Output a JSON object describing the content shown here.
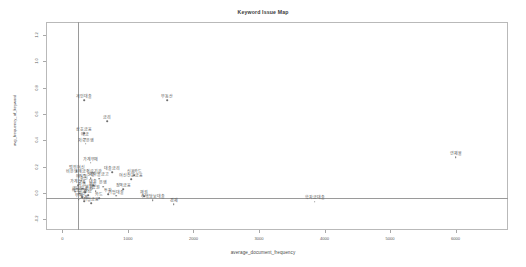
{
  "chart_data": {
    "type": "scatter",
    "title": "Keyword Issue Map",
    "xlabel": "average_document_frequency",
    "ylabel": "avg_frequency_of_keyword",
    "xlim": [
      -250,
      6800
    ],
    "ylim": [
      -0.28,
      1.3
    ],
    "grid": false,
    "legend": null,
    "reference_lines": {
      "x": 620,
      "y": 0.0
    },
    "xticks": [
      0,
      1000,
      2000,
      3000,
      4000,
      5000,
      6000
    ],
    "xtick_labels": [
      "0",
      "1000",
      "2000",
      "3000",
      "4000",
      "5000",
      "6000"
    ],
    "yticks": [
      -0.2,
      0.0,
      0.2,
      0.4,
      0.6,
      0.8,
      1.0,
      1.2
    ],
    "ytick_labels": [
      "-0.2",
      "0.0",
      "0.2",
      "0.4",
      "0.6",
      "0.8",
      "1.0",
      "1.2"
    ],
    "points": [
      {
        "label": "개인대출",
        "x": 330,
        "y": 0.705
      },
      {
        "label": "금리",
        "x": 680,
        "y": 0.545
      },
      {
        "label": "상호금융",
        "x": 330,
        "y": 0.455
      },
      {
        "label": "예금",
        "x": 350,
        "y": 0.415
      },
      {
        "label": "저축은행",
        "x": 355,
        "y": 0.375
      },
      {
        "label": "부동산",
        "x": 1600,
        "y": 0.705
      },
      {
        "label": "연체율",
        "x": 6000,
        "y": 0.275
      },
      {
        "label": "가계부채",
        "x": 430,
        "y": 0.23
      },
      {
        "label": "범위여신",
        "x": 220,
        "y": 0.165
      },
      {
        "label": "비은행예금취급기관",
        "x": 330,
        "y": 0.14
      },
      {
        "label": "대출금리",
        "x": 760,
        "y": 0.16
      },
      {
        "label": "신용카드",
        "x": 1100,
        "y": 0.135
      },
      {
        "label": "신협",
        "x": 430,
        "y": 0.115
      },
      {
        "label": "새마을금고",
        "x": 560,
        "y": 0.11
      },
      {
        "label": "여신전문금융",
        "x": 1050,
        "y": 0.105
      },
      {
        "label": "수신",
        "x": 330,
        "y": 0.08
      },
      {
        "label": "가계신용",
        "x": 240,
        "y": 0.06
      },
      {
        "label": "대출",
        "x": 470,
        "y": 0.06
      },
      {
        "label": "은행",
        "x": 620,
        "y": 0.05
      },
      {
        "label": "자금",
        "x": 300,
        "y": 0.035
      },
      {
        "label": "정책금융",
        "x": 930,
        "y": 0.03
      },
      {
        "label": "보험",
        "x": 400,
        "y": 0.02
      },
      {
        "label": "증권",
        "x": 510,
        "y": 0.015
      },
      {
        "label": "금융회사",
        "x": 350,
        "y": 0.005
      },
      {
        "label": "예금은행",
        "x": 260,
        "y": -0.005
      },
      {
        "label": "투자",
        "x": 700,
        "y": -0.01
      },
      {
        "label": "기업대출",
        "x": 820,
        "y": -0.02
      },
      {
        "label": "채권",
        "x": 1250,
        "y": -0.025
      },
      {
        "label": "주택담보대출",
        "x": 1380,
        "y": -0.055
      },
      {
        "label": "경제",
        "x": 1700,
        "y": -0.085
      },
      {
        "label": "기업금융",
        "x": 440,
        "y": -0.075
      },
      {
        "label": "가계",
        "x": 330,
        "y": -0.06
      },
      {
        "label": "학자금대출",
        "x": 3850,
        "y": -0.065
      },
      {
        "label": "자산",
        "x": 300,
        "y": -0.03
      },
      {
        "label": "부채",
        "x": 250,
        "y": -0.045
      },
      {
        "label": "연금",
        "x": 390,
        "y": -0.015
      },
      {
        "label": "펀드",
        "x": 460,
        "y": 0.035
      },
      {
        "label": "예적금",
        "x": 290,
        "y": 0.095
      },
      {
        "label": "금융",
        "x": 200,
        "y": 0.01
      },
      {
        "label": "카드",
        "x": 560,
        "y": -0.04
      }
    ]
  },
  "colors": {
    "frame": "#b9b9b9",
    "reference_line": "#9a9a9a",
    "point": "#6e6e6e",
    "text": "#4a4a4a",
    "background": "#ffffff"
  }
}
